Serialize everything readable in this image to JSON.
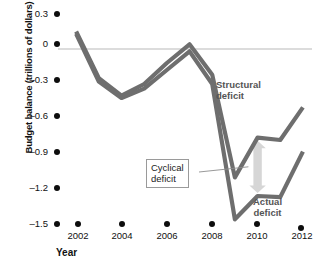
{
  "chart_data": {
    "type": "line",
    "title": "",
    "xlabel": "Year",
    "ylabel": "Budget balance (trillions of dollars)",
    "xlim": [
      2001.2,
      2012.4
    ],
    "ylim": [
      -1.5,
      0.3
    ],
    "grid": false,
    "legend_position": "inline-annotations",
    "xticks": [
      "2002",
      "2004",
      "2006",
      "2008",
      "2010",
      "2012"
    ],
    "xtick_values": [
      2002,
      2004,
      2006,
      2008,
      2010,
      2012
    ],
    "yticks": [
      "0.3",
      "0",
      "–0.3",
      "–0.6",
      "–0.9",
      "–1.2",
      "–1.5"
    ],
    "ytick_values": [
      0.3,
      0,
      -0.3,
      -0.6,
      -0.9,
      -1.2,
      -1.5
    ],
    "zero_line": 0,
    "x": [
      2002,
      2003,
      2004,
      2005,
      2006,
      2007,
      2008,
      2009,
      2010,
      2011,
      2012
    ],
    "series": [
      {
        "name": "Structural deficit",
        "color": "#6e6e6e",
        "values": [
          0.15,
          -0.25,
          -0.4,
          -0.3,
          -0.12,
          0.04,
          -0.22,
          -1.1,
          -0.76,
          -0.78,
          -0.5
        ]
      },
      {
        "name": "Actual deficit",
        "color": "#6e6e6e",
        "values": [
          0.13,
          -0.28,
          -0.42,
          -0.34,
          -0.18,
          -0.02,
          -0.3,
          -1.46,
          -1.26,
          -1.27,
          -0.88
        ]
      }
    ],
    "annotations": [
      {
        "text": "Structural deficit",
        "target_series": "Structural deficit"
      },
      {
        "text": "Actual deficit",
        "target_series": "Actual deficit"
      },
      {
        "text": "Cyclical deficit",
        "boxed": true,
        "describes": "vertical gap between structural and actual deficit lines near 2010"
      }
    ],
    "arrow": {
      "name": "cyclical-deficit-arrow",
      "color": "#d6d6d6",
      "orientation": "vertical-double-headed",
      "x_value": 2010,
      "y_from": -0.76,
      "y_to": -1.26
    },
    "colors": {
      "line": "#6e6e6e",
      "zero_line": "#b9b9b9",
      "arrow": "#d6d6d6",
      "tick_dot": "#0d0d0d",
      "annotation_text": "#555555",
      "box_border": "#9a9a9a"
    }
  },
  "annotations_text": {
    "structural_line1": "Structural",
    "structural_line2": "deficit",
    "actual_line1": "Actual",
    "actual_line2": "deficit",
    "cyclical_line1": "Cyclical",
    "cyclical_line2": "deficit"
  }
}
